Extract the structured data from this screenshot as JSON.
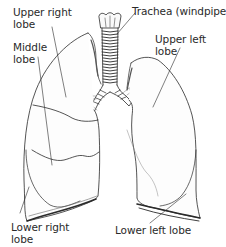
{
  "diagram": {
    "labels": {
      "upper_right_lobe": "Upper right\nlobe",
      "middle_lobe": "Middle\nlobe",
      "trachea": "Trachea (windpipe)",
      "upper_left_lobe": "Upper left\nlobe",
      "lower_right_lobe": "Lower right\nlobe",
      "lower_left_lobe": "Lower left lobe"
    },
    "colors": {
      "line": "#2a2a2a",
      "shading": "#d8d8d8",
      "background": "#ffffff"
    }
  }
}
